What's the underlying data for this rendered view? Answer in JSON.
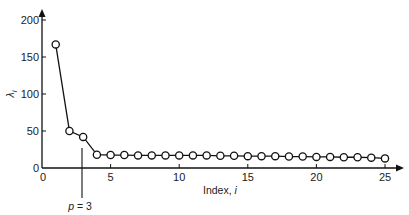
{
  "chart_data": {
    "type": "line",
    "title": "",
    "xlabel": "Index, i",
    "ylabel": "λi",
    "xlim": [
      0,
      25
    ],
    "ylim": [
      0,
      200
    ],
    "grid": false,
    "legend": null,
    "x_ticks": [
      0,
      5,
      10,
      15,
      20,
      25
    ],
    "y_ticks": [
      0,
      50,
      100,
      150,
      200
    ],
    "markers": "open-circle",
    "series": [
      {
        "name": "λi",
        "x": [
          1,
          2,
          3,
          4,
          5,
          6,
          7,
          8,
          9,
          10,
          11,
          12,
          13,
          14,
          15,
          16,
          17,
          18,
          19,
          20,
          21,
          22,
          23,
          24,
          25
        ],
        "values": [
          167,
          50,
          42,
          18,
          17.5,
          17.5,
          17,
          17,
          17,
          17,
          17,
          17,
          16.5,
          16.5,
          16,
          16,
          16,
          15.5,
          15.5,
          15,
          15,
          14.5,
          14.5,
          14,
          13
        ]
      }
    ],
    "annotations": [
      {
        "type": "vline",
        "x": 2.85,
        "label": "p = 3",
        "label_prefix": "p",
        "label_suffix": " = 3"
      }
    ]
  },
  "axes": {
    "x_label_main": "Index, ",
    "x_label_var": "i",
    "y_label_main": "λ",
    "y_label_sub": "i",
    "x_tick_labels": [
      "0",
      "5",
      "10",
      "15",
      "20",
      "25"
    ],
    "y_tick_labels": [
      "0",
      "50",
      "100",
      "150",
      "200"
    ]
  },
  "annotation": {
    "p_var": "p",
    "p_rest": " = 3"
  }
}
